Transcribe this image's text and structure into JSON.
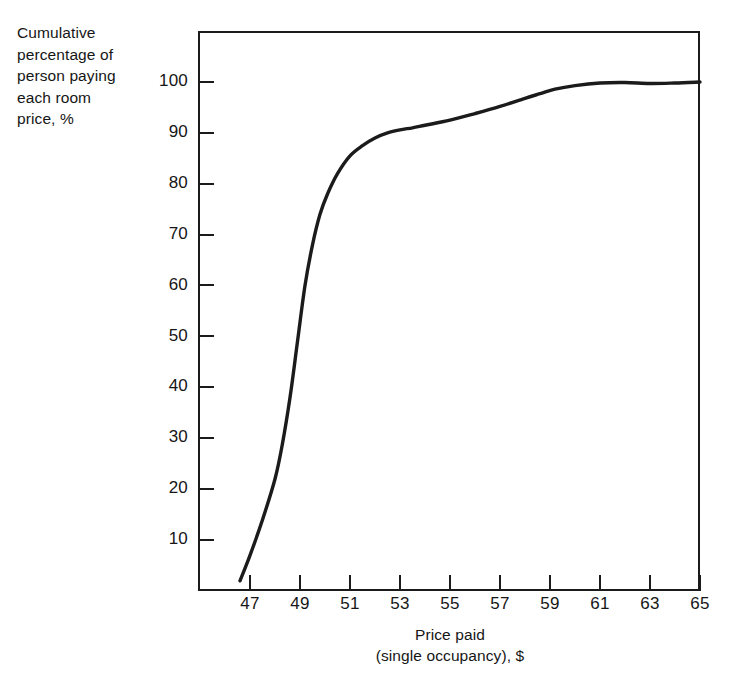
{
  "figure": {
    "background_color": "#ffffff",
    "line_color": "#1b1b1b",
    "axis_color": "#1b1b1b"
  },
  "ylabel_lines": [
    "Cumulative",
    "percentage of",
    "person paying",
    "each room",
    "price, %"
  ],
  "xlabel_lines": [
    "Price paid",
    "(single occupancy), $"
  ],
  "yticks": [
    {
      "value": 10,
      "label": "10"
    },
    {
      "value": 20,
      "label": "20"
    },
    {
      "value": 30,
      "label": "30"
    },
    {
      "value": 40,
      "label": "40"
    },
    {
      "value": 50,
      "label": "50"
    },
    {
      "value": 60,
      "label": "60"
    },
    {
      "value": 70,
      "label": "70"
    },
    {
      "value": 80,
      "label": "80"
    },
    {
      "value": 90,
      "label": "90"
    },
    {
      "value": 100,
      "label": "100"
    }
  ],
  "xticks": [
    {
      "value": 47,
      "label": "47"
    },
    {
      "value": 49,
      "label": "49"
    },
    {
      "value": 51,
      "label": "51"
    },
    {
      "value": 53,
      "label": "53"
    },
    {
      "value": 55,
      "label": "55"
    },
    {
      "value": 57,
      "label": "57"
    },
    {
      "value": 59,
      "label": "59"
    },
    {
      "value": 61,
      "label": "61"
    },
    {
      "value": 63,
      "label": "63"
    },
    {
      "value": 65,
      "label": "65"
    }
  ],
  "chart_data": {
    "type": "line",
    "title": "",
    "xlabel": "Price paid (single occupancy), $",
    "ylabel": "Cumulative percentage of person paying each room price, %",
    "xlim": [
      45.9,
      65.0
    ],
    "ylim": [
      0,
      104
    ],
    "grid": false,
    "legend": "none",
    "series": [
      {
        "name": "Cumulative percentage of persons paying each room price",
        "x": [
          46.6,
          47.0,
          47.5,
          48.0,
          48.3,
          48.6,
          48.9,
          49.2,
          49.5,
          49.8,
          50.1,
          50.5,
          51.0,
          51.5,
          52.0,
          52.5,
          53.0,
          53.5,
          54.0,
          55.0,
          56.0,
          57.0,
          58.0,
          58.6,
          59.2,
          60.0,
          61.0,
          62.0,
          63.0,
          64.0,
          65.0
        ],
        "y": [
          2,
          7,
          14,
          22,
          29,
          38,
          49,
          60,
          68,
          74,
          78,
          82,
          85.5,
          87.5,
          89,
          90,
          90.6,
          91,
          91.5,
          92.5,
          93.8,
          95.2,
          96.8,
          97.7,
          98.6,
          99.3,
          99.8,
          99.9,
          99.7,
          99.8,
          100
        ]
      }
    ]
  }
}
